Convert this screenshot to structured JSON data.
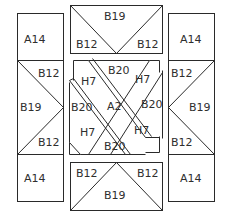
{
  "diagram": {
    "title": "",
    "colors": {
      "line": "#2a2a2a",
      "text": "#2e2e2e",
      "background": "#ffffff"
    },
    "left_column": {
      "top": "A14",
      "middle": {
        "center": "B19",
        "top_triangle": "B12",
        "bottom_triangle": "B12"
      },
      "bottom": "A14"
    },
    "right_column": {
      "top": "A14",
      "middle": {
        "center": "B19",
        "top_triangle": "B12",
        "bottom_triangle": "B12"
      },
      "bottom": "A14"
    },
    "top_block": {
      "center": "B19",
      "left_triangle": "B12",
      "right_triangle": "B12"
    },
    "bottom_block": {
      "center": "B19",
      "left_triangle": "B12",
      "right_triangle": "B12"
    },
    "center_block": {
      "center": "A2",
      "top": "B20",
      "right": "B20",
      "bottom": "B20",
      "left": "B20",
      "top_left": "H7",
      "top_right": "H7",
      "bottom_left": "H7",
      "bottom_right": "H7"
    }
  }
}
